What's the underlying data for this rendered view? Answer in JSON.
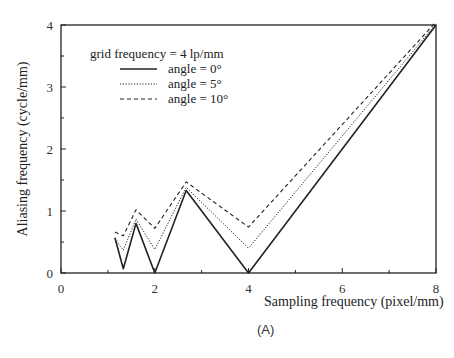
{
  "chart_data": {
    "type": "line",
    "title": "",
    "xlabel": "Sampling frequency (pixel/mm)",
    "ylabel": "Aliasing frequency (cycle/mm)",
    "xlim": [
      0,
      8
    ],
    "ylim": [
      0,
      4
    ],
    "xticks": [
      0,
      2,
      4,
      6,
      8
    ],
    "yticks": [
      0,
      1,
      2,
      3,
      4
    ],
    "grid": false,
    "legend_title": "grid frequency = 4 lp/mm",
    "legend_position": "upper-left",
    "series": [
      {
        "name": "angle = 0°",
        "style": "solid",
        "x": [
          1.15,
          1.33,
          1.6,
          2.0,
          2.67,
          4.0,
          8.0
        ],
        "y": [
          0.57,
          0.07,
          0.8,
          0.0,
          1.33,
          0.0,
          4.0
        ]
      },
      {
        "name": "angle = 5°",
        "style": "dotted",
        "x": [
          1.15,
          1.33,
          1.6,
          2.0,
          2.67,
          4.0,
          8.0
        ],
        "y": [
          0.55,
          0.37,
          0.87,
          0.38,
          1.38,
          0.4,
          4.02
        ]
      },
      {
        "name": "angle = 10°",
        "style": "dashed",
        "x": [
          1.15,
          1.33,
          1.6,
          2.0,
          2.67,
          4.0,
          8.0
        ],
        "y": [
          0.66,
          0.6,
          1.02,
          0.72,
          1.47,
          0.74,
          4.05
        ]
      }
    ]
  },
  "caption": "(A)"
}
